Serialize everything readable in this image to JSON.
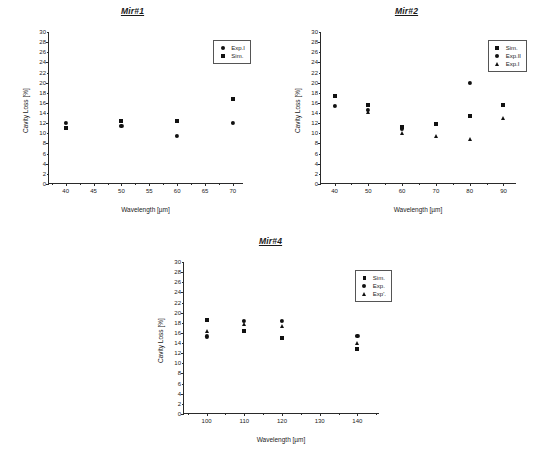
{
  "figure": {
    "background": "#ffffff",
    "marker_color": "#111111",
    "axis_color": "#2a2a2a"
  },
  "chart_data": [
    {
      "type": "scatter",
      "title": "Mir#1",
      "xlabel": "Wavelength [µm]",
      "ylabel": "Cavity Loss [%]",
      "xlim": [
        37,
        72
      ],
      "ylim": [
        0,
        30
      ],
      "xticks": [
        40,
        45,
        50,
        55,
        60,
        65,
        70
      ],
      "yticks": [
        0,
        2,
        4,
        6,
        8,
        10,
        12,
        14,
        16,
        18,
        20,
        22,
        24,
        26,
        28,
        30
      ],
      "grid": false,
      "legend_position": "top-right",
      "series": [
        {
          "name": "Exp.I",
          "marker": "circle",
          "x": [
            40,
            50,
            60,
            70
          ],
          "y": [
            12.1,
            11.5,
            9.5,
            12.0
          ]
        },
        {
          "name": "Sim.",
          "marker": "square",
          "x": [
            40,
            50,
            60,
            70
          ],
          "y": [
            11.0,
            12.4,
            12.5,
            16.7
          ]
        }
      ]
    },
    {
      "type": "scatter",
      "title": "Mir#2",
      "xlabel": "Wavelength [µm]",
      "ylabel": "Cavity Loss [%]",
      "xlim": [
        36,
        94
      ],
      "ylim": [
        0,
        30
      ],
      "xticks": [
        40,
        50,
        60,
        70,
        80,
        90
      ],
      "yticks": [
        0,
        2,
        4,
        6,
        8,
        10,
        12,
        14,
        16,
        18,
        20,
        22,
        24,
        26,
        28,
        30
      ],
      "grid": false,
      "legend_position": "top-right",
      "series": [
        {
          "name": "Sim.",
          "marker": "square",
          "x": [
            40,
            50,
            60,
            70,
            80,
            90
          ],
          "y": [
            17.3,
            15.6,
            11.3,
            11.8,
            13.4,
            15.6
          ]
        },
        {
          "name": "Exp.II",
          "marker": "circle",
          "x": [
            40,
            50,
            60,
            80
          ],
          "y": [
            15.4,
            14.7,
            10.9,
            19.9
          ]
        },
        {
          "name": "Exp.I",
          "marker": "triangle",
          "x": [
            50,
            60,
            70,
            80,
            90
          ],
          "y": [
            14.3,
            10.0,
            9.4,
            8.9,
            13.0
          ]
        }
      ]
    },
    {
      "type": "scatter",
      "title": "Mir#4",
      "xlabel": "Wavelength [µm]",
      "ylabel": "Cavity Loss [%]",
      "xlim": [
        94,
        146
      ],
      "ylim": [
        0,
        30
      ],
      "xticks": [
        100,
        110,
        120,
        130,
        140
      ],
      "yticks": [
        0,
        2,
        4,
        6,
        8,
        10,
        12,
        14,
        16,
        18,
        20,
        22,
        24,
        26,
        28,
        30
      ],
      "grid": false,
      "legend_position": "top-right",
      "series": [
        {
          "name": "Sim.",
          "marker": "square",
          "x": [
            100,
            110,
            120,
            140
          ],
          "y": [
            18.6,
            16.4,
            15.0,
            12.8
          ]
        },
        {
          "name": "Exp.",
          "marker": "circle",
          "x": [
            100,
            110,
            120,
            140
          ],
          "y": [
            15.3,
            18.4,
            18.4,
            15.4
          ]
        },
        {
          "name": "Exp'.",
          "marker": "triangle",
          "x": [
            100,
            110,
            120,
            140
          ],
          "y": [
            16.3,
            17.7,
            17.3,
            14.1
          ]
        }
      ]
    }
  ]
}
